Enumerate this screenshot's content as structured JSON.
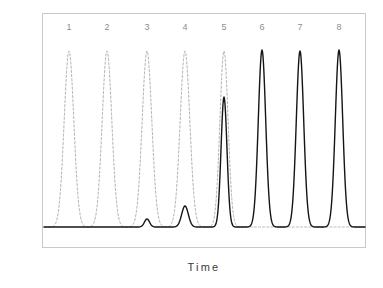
{
  "figure": {
    "background_color": "#ffffff",
    "frame_color": "#c9c9c9",
    "axis_label_color": "#3a3a3a",
    "peak_label_color": "#8d8d8d"
  },
  "axes": {
    "ylabel": "Signal",
    "xlabel": "Time"
  },
  "peak_labels": [
    {
      "text": "1",
      "x": 69
    },
    {
      "text": "2",
      "x": 107
    },
    {
      "text": "3",
      "x": 147
    },
    {
      "text": "4",
      "x": 185
    },
    {
      "text": "5",
      "x": 224
    },
    {
      "text": "6",
      "x": 262
    },
    {
      "text": "7",
      "x": 300
    },
    {
      "text": "8",
      "x": 339
    }
  ],
  "chart_data": {
    "type": "line",
    "title": "",
    "xlabel": "Time",
    "ylabel": "Signal",
    "x_axis_ticks": [],
    "y_axis_ticks": [],
    "grid": false,
    "legend": "none",
    "xlim": [
      0,
      1
    ],
    "ylim": [
      0,
      1
    ],
    "series": [
      {
        "name": "dashed-trace",
        "style": "dashed",
        "color": "#b4b4b4",
        "linewidth": 1.0,
        "baseline_signal": 0.02,
        "peaks": [
          {
            "label": "1",
            "center_px": 69,
            "apex_px_y": 51,
            "height_rel": 0.9,
            "width_px": 13
          },
          {
            "label": "2",
            "center_px": 107,
            "apex_px_y": 51,
            "height_rel": 0.9,
            "width_px": 13
          },
          {
            "label": "3",
            "center_px": 147,
            "apex_px_y": 51,
            "height_rel": 0.9,
            "width_px": 13
          },
          {
            "label": "4",
            "center_px": 185,
            "apex_px_y": 51,
            "height_rel": 0.9,
            "width_px": 13
          },
          {
            "label": "5",
            "center_px": 224,
            "apex_px_y": 51,
            "height_rel": 0.9,
            "width_px": 11
          }
        ]
      },
      {
        "name": "solid-trace",
        "style": "solid",
        "color": "#151515",
        "linewidth": 1.4,
        "baseline_signal": 0.02,
        "peaks": [
          {
            "label": "3",
            "center_px": 147,
            "apex_px_y": 219,
            "height_rel": 0.05,
            "width_px": 7
          },
          {
            "label": "4",
            "center_px": 185,
            "apex_px_y": 206,
            "height_rel": 0.12,
            "width_px": 9
          },
          {
            "label": "5",
            "center_px": 224,
            "apex_px_y": 97,
            "height_rel": 0.66,
            "width_px": 8
          },
          {
            "label": "6",
            "center_px": 262,
            "apex_px_y": 50,
            "height_rel": 0.9,
            "width_px": 10
          },
          {
            "label": "7",
            "center_px": 300,
            "apex_px_y": 51,
            "height_rel": 0.89,
            "width_px": 10
          },
          {
            "label": "8",
            "center_px": 339,
            "apex_px_y": 50,
            "height_rel": 0.9,
            "width_px": 10
          }
        ]
      }
    ],
    "plot_area_px": {
      "left": 42,
      "top": 13,
      "right": 366,
      "bottom": 248,
      "baseline_y": 227
    }
  }
}
